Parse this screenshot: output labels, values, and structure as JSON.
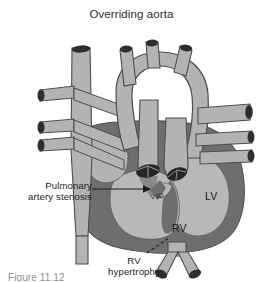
{
  "figure": {
    "title": "Overriding aorta",
    "caption_partial": "Figure 11.12",
    "background_color": "#ffffff",
    "text_color": "#231f20"
  },
  "palette": {
    "vessel_fill": "#b3b3b3",
    "vessel_stroke": "#4d4d4d",
    "myocardium": "#6e6e6e",
    "chamber_fill": "#b8b8b8",
    "lumen_dark": "#2e2e2e",
    "leader_line": "#1a1a1a"
  },
  "labels": {
    "pulmonary_artery_stenosis": "Pulmonary\nartery stenosis",
    "rv_hypertrophy": "RV\nhypertrophy",
    "vsd": "VSD",
    "lv": "LV",
    "rv": "RV"
  },
  "annotations": {
    "arrow": {
      "name": "pulmonary-stenosis-arrow",
      "style": "solid",
      "from_x": 92,
      "from_y": 189,
      "to_x": 147,
      "to_y": 189,
      "head": "right"
    },
    "dashed_leader": {
      "name": "rv-hypertrophy-leader",
      "style": "dashed",
      "from_x": 147,
      "from_y": 253,
      "to_x": 168,
      "to_y": 238
    }
  },
  "structures": [
    {
      "name": "superior-vena-cava",
      "type": "vessel"
    },
    {
      "name": "aortic-arch",
      "type": "vessel"
    },
    {
      "name": "brachiocephalic-branches",
      "type": "vessel",
      "count": 3
    },
    {
      "name": "pulmonary-artery",
      "type": "vessel"
    },
    {
      "name": "pulmonary-veins",
      "type": "vessel",
      "count": 3
    },
    {
      "name": "left-ventricle",
      "type": "chamber"
    },
    {
      "name": "right-ventricle",
      "type": "chamber"
    },
    {
      "name": "ventricular-septal-defect",
      "type": "defect"
    },
    {
      "name": "descending-aorta",
      "type": "vessel"
    },
    {
      "name": "aortic-valve-opening",
      "type": "valve"
    },
    {
      "name": "pulmonary-valve-opening",
      "type": "valve"
    }
  ]
}
